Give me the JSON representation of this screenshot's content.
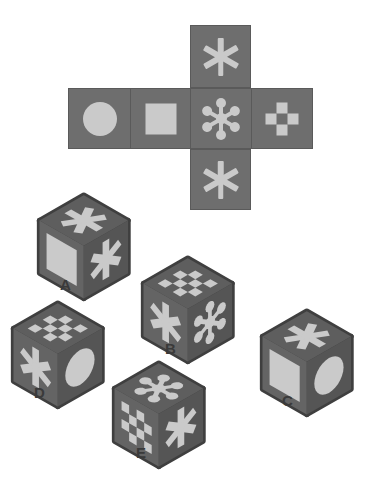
{
  "puzzle": {
    "type": "cube-net-folding",
    "title": "",
    "symbol_names": {
      "circle": "circle-symbol",
      "square": "square-symbol",
      "asterisk": "asterisk-symbol",
      "molecule": "molecule-symbol",
      "checker_plus": "checkered-plus-symbol",
      "checkerboard": "checkerboard-symbol"
    }
  },
  "colors": {
    "background": "#ffffff",
    "face": "#6e6e6e",
    "face_edge": "#5a5a5a",
    "cube_top": "#5e5e5e",
    "cube_left": "#646464",
    "cube_right": "#555555",
    "cube_outline": "#3f3f3f",
    "symbol": "#cacaca",
    "label_text": "#3a3a3a"
  },
  "net": {
    "name": "cube-net",
    "layout": "cross",
    "faces": [
      {
        "position": "top",
        "symbol": "asterisk",
        "label": "asterisk"
      },
      {
        "position": "left",
        "symbol": "circle",
        "label": "circle"
      },
      {
        "position": "mid",
        "symbol": "square",
        "label": "square"
      },
      {
        "position": "center",
        "symbol": "molecule",
        "label": "molecule"
      },
      {
        "position": "right",
        "symbol": "checker_plus",
        "label": "checkered plus"
      },
      {
        "position": "bottom",
        "symbol": "asterisk",
        "label": "asterisk"
      }
    ]
  },
  "options": [
    {
      "id": "A",
      "label": "A",
      "top": "asterisk",
      "left": "square",
      "right": "asterisk"
    },
    {
      "id": "B",
      "label": "B",
      "top": "checkerboard",
      "left": "asterisk",
      "right": "molecule"
    },
    {
      "id": "C",
      "label": "C",
      "top": "asterisk",
      "left": "square",
      "right": "circle"
    },
    {
      "id": "D",
      "label": "D",
      "top": "checkerboard",
      "left": "asterisk",
      "right": "circle"
    },
    {
      "id": "E",
      "label": "E",
      "top": "molecule",
      "left": "checkerboard",
      "right": "asterisk"
    }
  ]
}
